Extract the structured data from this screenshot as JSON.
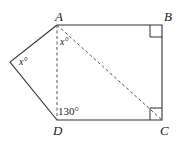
{
  "diagram": {
    "type": "geometry-pentagon",
    "vertices": {
      "A": {
        "label": "A",
        "x": 57,
        "y": 25
      },
      "B": {
        "label": "B",
        "x": 162,
        "y": 25
      },
      "C": {
        "label": "C",
        "x": 162,
        "y": 120
      },
      "D": {
        "label": "D",
        "x": 57,
        "y": 120
      },
      "E": {
        "label": "",
        "x": 10,
        "y": 62
      }
    },
    "solid_edges": [
      "E-A",
      "A-B",
      "B-C",
      "C-D",
      "D-E"
    ],
    "dashed_segments": [
      "A-D",
      "A-C"
    ],
    "right_angle_marks": [
      "B",
      "C"
    ],
    "angle_labels": {
      "left_vertex": "x°",
      "at_A": "x°",
      "at_D": "130°"
    },
    "colors": {
      "line": "#333333",
      "dashed": "#555555",
      "text": "#222222",
      "background": "#ffffff"
    }
  }
}
